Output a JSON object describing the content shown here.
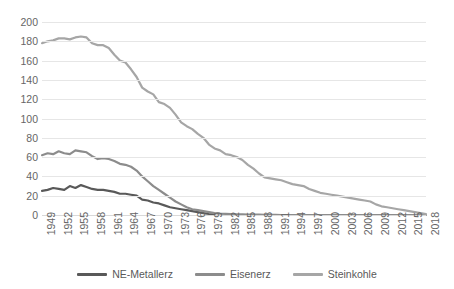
{
  "chart_data": {
    "type": "line",
    "title": "",
    "xlabel": "",
    "ylabel": "",
    "ylim": [
      0,
      200
    ],
    "ytick_labels": [
      "200",
      "180",
      "160",
      "140",
      "120",
      "100",
      "80",
      "60",
      "40",
      "20",
      "0"
    ],
    "ytick_values": [
      200,
      180,
      160,
      140,
      120,
      100,
      80,
      60,
      40,
      20,
      0
    ],
    "grid": true,
    "legend_position": "bottom",
    "x": [
      1949,
      1950,
      1951,
      1952,
      1953,
      1954,
      1955,
      1956,
      1957,
      1958,
      1959,
      1960,
      1961,
      1962,
      1963,
      1964,
      1965,
      1966,
      1967,
      1968,
      1969,
      1970,
      1971,
      1972,
      1973,
      1974,
      1975,
      1976,
      1977,
      1978,
      1979,
      1980,
      1981,
      1982,
      1983,
      1984,
      1985,
      1986,
      1987,
      1988,
      1989,
      1990,
      1991,
      1992,
      1993,
      1994,
      1995,
      1996,
      1997,
      1998,
      1999,
      2000,
      2001,
      2002,
      2003,
      2004,
      2005,
      2006,
      2007,
      2008,
      2009,
      2010,
      2011,
      2012,
      2013,
      2014,
      2015,
      2016,
      2017,
      2018
    ],
    "xtick_labels": [
      "1949",
      "1952",
      "1955",
      "1958",
      "1961",
      "1964",
      "1967",
      "1970",
      "1973",
      "1976",
      "1979",
      "1982",
      "1985",
      "1988",
      "1991",
      "1994",
      "1997",
      "2000",
      "2003",
      "2006",
      "2009",
      "2012",
      "2015",
      "2018"
    ],
    "xtick_values": [
      1949,
      1952,
      1955,
      1958,
      1961,
      1964,
      1967,
      1970,
      1973,
      1976,
      1979,
      1982,
      1985,
      1988,
      1991,
      1994,
      1997,
      2000,
      2003,
      2006,
      2009,
      2012,
      2015,
      2018
    ],
    "series": [
      {
        "name": "NE-Metallerz",
        "color": "#595959",
        "width": 2.2,
        "values": [
          25,
          26,
          28,
          27,
          26,
          30,
          28,
          31,
          29,
          27,
          26,
          26,
          25,
          24,
          22,
          22,
          21,
          20,
          16,
          15,
          13,
          12,
          10,
          8,
          7,
          6,
          5,
          4,
          3,
          2,
          1,
          0.5,
          null,
          null,
          null,
          null,
          null,
          null,
          null,
          null,
          null,
          null,
          null,
          null,
          null,
          null,
          null,
          null,
          null,
          null,
          null,
          null,
          null,
          null,
          null,
          null,
          null,
          null,
          null,
          null,
          null,
          null,
          null,
          null,
          null,
          null,
          null,
          null,
          null,
          null
        ]
      },
      {
        "name": "Eisenerz",
        "color": "#8c8c8c",
        "width": 2.2,
        "values": [
          62,
          64,
          63,
          66,
          64,
          63,
          67,
          66,
          65,
          61,
          58,
          59,
          58,
          56,
          53,
          52,
          50,
          46,
          40,
          35,
          30,
          26,
          22,
          18,
          14,
          11,
          8,
          6,
          5,
          4,
          3,
          2,
          1.5,
          1.2,
          1,
          0.8,
          0.6,
          0.5,
          0.4,
          0.3,
          0.2,
          0.1,
          0.05,
          0,
          0,
          0,
          0,
          0,
          0,
          0,
          0,
          0,
          0,
          0,
          0,
          0,
          0,
          0,
          0,
          0,
          0,
          0,
          0,
          0,
          0,
          0,
          0,
          0,
          0,
          0
        ]
      },
      {
        "name": "Steinkohle",
        "color": "#a6a6a6",
        "width": 2.2,
        "values": [
          178,
          180,
          181,
          183,
          183,
          182,
          184,
          185,
          184,
          178,
          176,
          176,
          173,
          166,
          160,
          158,
          151,
          143,
          132,
          128,
          125,
          117,
          115,
          111,
          104,
          96,
          92,
          89,
          84,
          80,
          73,
          69,
          67,
          63,
          62,
          60,
          57,
          52,
          48,
          43,
          39,
          38,
          37,
          36,
          34,
          32,
          31,
          30,
          27,
          25,
          23,
          22,
          21,
          20,
          19,
          18,
          17,
          16,
          15,
          14,
          11,
          9,
          8,
          7,
          6,
          5,
          4,
          3,
          2,
          1
        ]
      }
    ]
  },
  "legend": {
    "items": [
      {
        "label": "NE-Metallerz",
        "color": "#595959"
      },
      {
        "label": "Eisenerz",
        "color": "#8c8c8c"
      },
      {
        "label": "Steinkohle",
        "color": "#a6a6a6"
      }
    ]
  }
}
